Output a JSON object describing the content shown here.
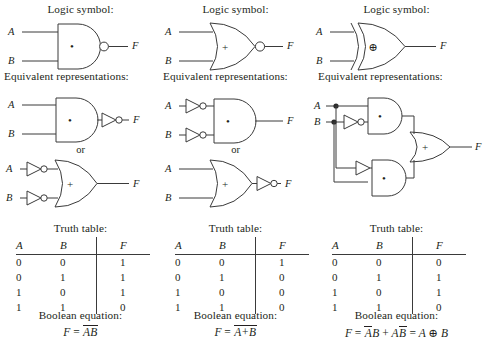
{
  "figure": {
    "section_labels": {
      "logic_symbol": "Logic symbol:",
      "equivalent": "Equivalent representations:",
      "or_separator": "or",
      "truth_table": "Truth table:",
      "boolean_equation": "Boolean equation:"
    },
    "table_headers": [
      "A",
      "B",
      "F"
    ],
    "signal_labels": {
      "a": "A",
      "b": "B",
      "f": "F"
    },
    "gate_glyphs": {
      "and": "•",
      "or": "+",
      "xor": "⊕"
    }
  },
  "columns": [
    {
      "id": "nand",
      "gate_name": "NAND",
      "logic_symbol_label": "Logic symbol:",
      "equivalent_label": "Equivalent representations:",
      "or_separator": "or",
      "truth_label": "Truth table:",
      "boolean_label": "Boolean equation:",
      "symbol": {
        "shape": "and",
        "glyph": "•",
        "output_bubble": true,
        "inputs": [
          "A",
          "B"
        ],
        "output": "F"
      },
      "equivalents": [
        {
          "shape": "and",
          "glyph": "•",
          "input_bubbles": [
            false,
            false
          ],
          "output_inverter": true,
          "inputs": [
            "A",
            "B"
          ],
          "output": "F"
        },
        {
          "shape": "or",
          "glyph": "+",
          "input_inverters": [
            true,
            true
          ],
          "output_bubble": false,
          "inputs": [
            "A",
            "B"
          ],
          "output": "F"
        }
      ],
      "truth_table": {
        "headers": [
          "A",
          "B",
          "F"
        ],
        "rows": [
          [
            "0",
            "0",
            "1"
          ],
          [
            "0",
            "1",
            "1"
          ],
          [
            "1",
            "0",
            "1"
          ],
          [
            "1",
            "1",
            "0"
          ]
        ]
      },
      "equation": {
        "lhs": "F",
        "rhs_plain": "F = AB (overbar over AB)",
        "parts": [
          {
            "text": "AB",
            "overbar": true
          }
        ]
      }
    },
    {
      "id": "nor",
      "gate_name": "NOR",
      "logic_symbol_label": "Logic symbol:",
      "equivalent_label": "Equivalent representations:",
      "or_separator": "or",
      "truth_label": "Truth table:",
      "boolean_label": "Boolean equation:",
      "symbol": {
        "shape": "or",
        "glyph": "+",
        "output_bubble": true,
        "inputs": [
          "A",
          "B"
        ],
        "output": "F"
      },
      "equivalents": [
        {
          "shape": "and",
          "glyph": "•",
          "input_inverters": [
            true,
            true
          ],
          "output_bubble": false,
          "inputs": [
            "A",
            "B"
          ],
          "output": "F"
        },
        {
          "shape": "or",
          "glyph": "+",
          "input_inverters": [
            false,
            false
          ],
          "output_inverter": true,
          "inputs": [
            "A",
            "B"
          ],
          "output": "F"
        }
      ],
      "truth_table": {
        "headers": [
          "A",
          "B",
          "F"
        ],
        "rows": [
          [
            "0",
            "0",
            "1"
          ],
          [
            "0",
            "1",
            "0"
          ],
          [
            "1",
            "0",
            "0"
          ],
          [
            "1",
            "1",
            "0"
          ]
        ]
      },
      "equation": {
        "lhs": "F",
        "rhs_plain": "F = A+B (overbar over A+B)",
        "parts": [
          {
            "text": "A+B",
            "overbar": true
          }
        ]
      }
    },
    {
      "id": "xor",
      "gate_name": "XOR",
      "logic_symbol_label": "Logic symbol:",
      "equivalent_label": "Equivalent representations:",
      "truth_label": "Truth table:",
      "boolean_label": "Boolean equation:",
      "symbol": {
        "shape": "xor",
        "glyph": "⊕",
        "output_bubble": false,
        "inputs": [
          "A",
          "B"
        ],
        "output": "F"
      },
      "equivalent_circuit": {
        "description": "A AND NOT-B, plus NOT-A AND B, into an OR gate",
        "gates": [
          {
            "shape": "and",
            "glyph": "•"
          },
          {
            "shape": "and",
            "glyph": "•"
          },
          {
            "shape": "or",
            "glyph": "+"
          }
        ],
        "inputs": [
          "A",
          "B"
        ],
        "output": "F"
      },
      "truth_table": {
        "headers": [
          "A",
          "B",
          "F"
        ],
        "rows": [
          [
            "0",
            "0",
            "0"
          ],
          [
            "0",
            "1",
            "1"
          ],
          [
            "1",
            "0",
            "1"
          ],
          [
            "1",
            "1",
            "0"
          ]
        ]
      },
      "equation": {
        "lhs": "F",
        "rhs_plain": "F = (not A)B + A(not B) = A xor B",
        "parts": [
          {
            "text": "A",
            "overbar": true
          },
          {
            "text": "B",
            "overbar": false
          },
          {
            "text": " + ",
            "overbar": false
          },
          {
            "text": "A",
            "overbar": false
          },
          {
            "text": "B",
            "overbar": true
          },
          {
            "text": " = ",
            "overbar": false
          },
          {
            "text": "A ⊕ B",
            "overbar": false
          }
        ]
      }
    }
  ],
  "colors": {
    "ink": "#231f20",
    "line": "#3a3a3a",
    "background": "#ffffff"
  }
}
